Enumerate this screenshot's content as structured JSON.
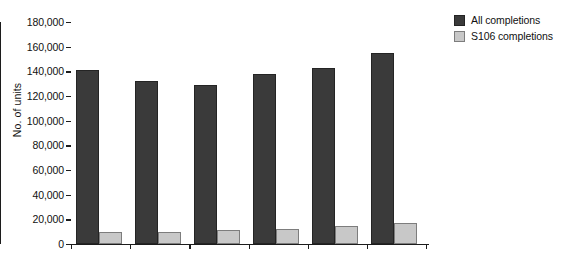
{
  "chart_data": {
    "type": "bar",
    "title": "",
    "subtitle": "",
    "xlabel": "",
    "ylabel": "No. of units",
    "ylim": [
      0,
      180000
    ],
    "ytick_step": 20000,
    "ytick_labels": [
      "0",
      "20,000",
      "40,000",
      "60,000",
      "80,000",
      "100,000",
      "120,000",
      "140,000",
      "160,000",
      "180,000"
    ],
    "ytick_values": [
      0,
      20000,
      40000,
      60000,
      80000,
      100000,
      120000,
      140000,
      160000,
      180000
    ],
    "grid": false,
    "legend_position": "top-right",
    "categories": [
      "1999/2000",
      "2000/01",
      "2001/02",
      "2002/03",
      "2003/04",
      "2004/05"
    ],
    "series": [
      {
        "name": "All completions",
        "color": "#3a3a3a",
        "values": [
          141000,
          132000,
          129000,
          138000,
          143000,
          155000
        ]
      },
      {
        "name": "S106 completions",
        "color": "#c8c8c8",
        "values": [
          10000,
          10000,
          11000,
          12000,
          15000,
          17000
        ]
      }
    ]
  },
  "colors": {
    "series_all": "#3a3a3a",
    "series_s106": "#c8c8c8",
    "axis": "#1c1c1c",
    "background": "#ffffff"
  }
}
